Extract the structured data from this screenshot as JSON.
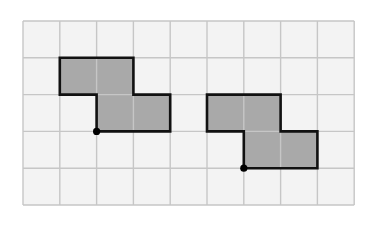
{
  "diagram": {
    "type": "grid-shapes",
    "grid": {
      "cols": 9,
      "rows": 5,
      "origin_x": 23,
      "origin_y": 21,
      "cell": 36.8
    },
    "colors": {
      "background": "#ffffff",
      "cell_fill": "#f3f3f3",
      "grid_line": "#c6c6c6",
      "shape_fill": "#a9a9a9",
      "shape_stroke": "#111111",
      "dot": "#000000"
    },
    "shapes": [
      {
        "name": "left-shape",
        "cells": [
          [
            1,
            1
          ],
          [
            2,
            1
          ],
          [
            2,
            2
          ],
          [
            3,
            2
          ]
        ],
        "outline": [
          [
            1,
            1
          ],
          [
            3,
            1
          ],
          [
            3,
            2
          ],
          [
            4,
            2
          ],
          [
            4,
            3
          ],
          [
            2,
            3
          ],
          [
            2,
            2
          ],
          [
            1,
            2
          ]
        ],
        "dot": [
          2,
          3
        ]
      },
      {
        "name": "right-shape",
        "cells": [
          [
            5,
            2
          ],
          [
            6,
            2
          ],
          [
            6,
            3
          ],
          [
            7,
            3
          ]
        ],
        "outline": [
          [
            5,
            2
          ],
          [
            7,
            2
          ],
          [
            7,
            3
          ],
          [
            8,
            3
          ],
          [
            8,
            4
          ],
          [
            6,
            4
          ],
          [
            6,
            3
          ],
          [
            5,
            3
          ]
        ],
        "dot": [
          6,
          4
        ]
      }
    ]
  }
}
